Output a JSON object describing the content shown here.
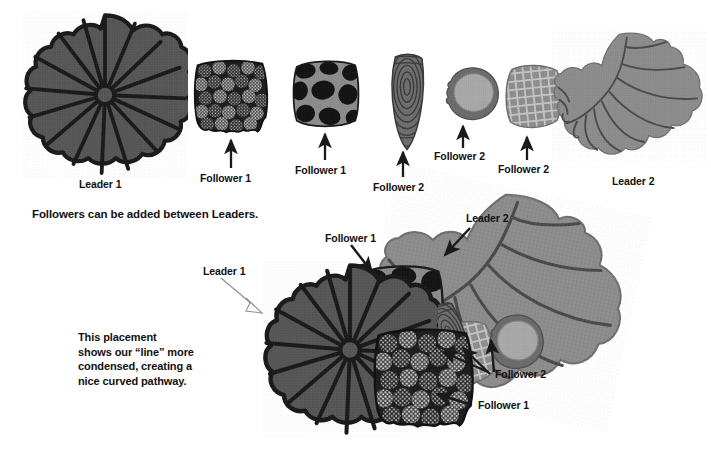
{
  "page": {
    "width": 711,
    "height": 454,
    "background": "#ffffff",
    "kind": "instructional-diagram"
  },
  "colors": {
    "ink": "#111111",
    "rosette_fill": "#565656",
    "rosette_outline": "#1a1a1a",
    "leader2_fill": "#8c8c8c",
    "leader2_vein": "#4a4a4a",
    "follower1_scales_bg": "#1f1f1f",
    "follower1_scales_dot": "#b9b9b9",
    "follower1_blob_bg": "#8a8a8a",
    "follower1_blob_dark": "#151515",
    "follower2_cone_fill": "#6e6e6e",
    "follower2_cone_line": "#3c3c3c",
    "follower2_round_rim": "#6b6b6b",
    "follower2_round_center": "#a6a6a6",
    "follower2_grid_fill": "#8f8f8f",
    "follower2_grid_line": "#c2c2c2",
    "arrow": "#1a1a1a"
  },
  "top_row": {
    "specimens": [
      {
        "id": "leader-1-rosette",
        "label": "Leader 1",
        "role": "Leader",
        "index": 1,
        "pattern": "radiating-petal-rosette",
        "has_arrow": false
      },
      {
        "id": "follower-1-scales",
        "label": "Follower 1",
        "role": "Follower",
        "index": 1,
        "pattern": "dark-speckled-scales",
        "has_arrow": true
      },
      {
        "id": "follower-1-blobs",
        "label": "Follower 1",
        "role": "Follower",
        "index": 1,
        "pattern": "gray-with-black-blobs",
        "has_arrow": true
      },
      {
        "id": "follower-2-cone",
        "label": "Follower 2",
        "role": "Follower",
        "index": 2,
        "pattern": "tapered-concentric-swirl",
        "has_arrow": true
      },
      {
        "id": "follower-2-round",
        "label": "Follower 2",
        "role": "Follower",
        "index": 2,
        "pattern": "round-rimmed-disc",
        "has_arrow": true
      },
      {
        "id": "follower-2-grid",
        "label": "Follower 2",
        "role": "Follower",
        "index": 2,
        "pattern": "checkered-grid-square",
        "has_arrow": true
      },
      {
        "id": "leader-2-leaf",
        "label": "Leader 2",
        "role": "Leader",
        "index": 2,
        "pattern": "veined-lobed-leaf",
        "has_arrow": false
      }
    ]
  },
  "caption": {
    "line": "Followers can be added between Leaders."
  },
  "composition": {
    "paragraph_lines": [
      "This placement",
      "shows our “line” more",
      "condensed, creating a",
      "nice curved pathway."
    ],
    "callouts": [
      {
        "id": "callout-leader-1",
        "label": "Leader 1",
        "arrow": "down-right",
        "style": "outline"
      },
      {
        "id": "callout-follower-1-top",
        "label": "Follower 1",
        "arrow": "down-right",
        "style": "solid"
      },
      {
        "id": "callout-leader-2",
        "label": "Leader 2",
        "arrow": "down-left",
        "style": "solid"
      },
      {
        "id": "callout-follower-2",
        "label": "Follower 2",
        "arrow": "multi-up-left",
        "style": "solid"
      },
      {
        "id": "callout-follower-1-bottom",
        "label": "Follower 1",
        "arrow": "left",
        "style": "solid"
      }
    ]
  }
}
